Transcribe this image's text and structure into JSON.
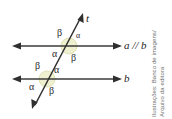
{
  "figure": {
    "type": "geometry-diagram",
    "lines": {
      "top_label": "a // b",
      "bottom_label": "b",
      "transversal_label": "t"
    },
    "angles": {
      "alpha": "α",
      "beta": "β"
    },
    "upper_intersection": {
      "top_left": "β",
      "top_right": "α",
      "bottom_left": "α",
      "bottom_right": "β"
    },
    "lower_intersection": {
      "top_left": "β",
      "top_right": "α",
      "bottom_left": "α",
      "bottom_right": "β"
    },
    "colors": {
      "line": "#3b3b3b",
      "transversal": "#2f2f2f",
      "angle_mark": "#e8e9c0",
      "label": "#1b1b1b"
    }
  },
  "credit": {
    "line1": "Ilustrações: Banco de imagens/",
    "line2": "Arquivo da editora"
  }
}
